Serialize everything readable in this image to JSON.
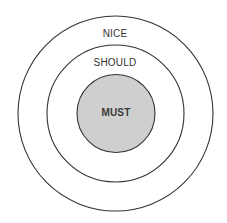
{
  "diagram": {
    "type": "concentric-circles",
    "rings": [
      {
        "label": "NICE",
        "fill": "#ffffff",
        "stroke": "#333333"
      },
      {
        "label": "SHOULD",
        "fill": "#ffffff",
        "stroke": "#333333"
      },
      {
        "label": "MUST",
        "fill": "#cfcfcf",
        "stroke": "#333333"
      }
    ]
  }
}
